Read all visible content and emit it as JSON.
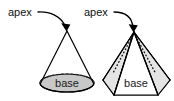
{
  "diagram": {
    "background_color": "#ffffff",
    "stroke_color": "#000000",
    "base_fill_color": "#c8c8c8",
    "face_fill_color": "#e2e2e2",
    "hidden_edge_style": "dashed",
    "figures": [
      {
        "name": "cone",
        "shape_type": "cone",
        "apex_label": "apex",
        "base_label": "base",
        "apex_point": {
          "x": 67,
          "y": 31
        },
        "base_ellipse": {
          "cx": 67,
          "cy": 83,
          "rx": 27,
          "ry": 9
        },
        "leader": {
          "text_x": 8,
          "text_y": 13,
          "arrow_tip": {
            "x": 66,
            "y": 31
          }
        }
      },
      {
        "name": "pyramid",
        "shape_type": "pyramid",
        "apex_label": "apex",
        "base_label": "base",
        "apex_point": {
          "x": 134,
          "y": 32
        },
        "base_polygon": [
          {
            "x": 103,
            "y": 80
          },
          {
            "x": 113,
            "y": 72
          },
          {
            "x": 155,
            "y": 72
          },
          {
            "x": 170,
            "y": 80
          },
          {
            "x": 158,
            "y": 95
          },
          {
            "x": 114,
            "y": 95
          }
        ],
        "leader": {
          "text_x": 84,
          "text_y": 13,
          "arrow_tip": {
            "x": 133,
            "y": 32
          }
        }
      }
    ]
  },
  "labels": {
    "apex_cone": "apex",
    "apex_pyramid": "apex",
    "base_cone": "base",
    "base_pyramid": "base"
  }
}
